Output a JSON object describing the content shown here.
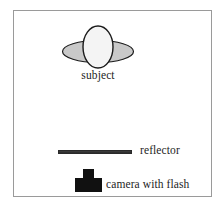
{
  "figure": {
    "background_color": "#ffffff",
    "frame_border_color": "#9a9a9a"
  },
  "elements": {
    "subject": {
      "label": "subject",
      "icon_name": "subject-head-and-shoulders-icon",
      "head_fill": "#f4f4f4",
      "shoulders_fill": "#c9c9c9",
      "outline_color": "#1b1b1b"
    },
    "reflector": {
      "label": "reflector",
      "icon_name": "reflector-bar-icon",
      "bar_fill": "#2f2f2f",
      "bar_highlight": "#8c8c8c"
    },
    "camera": {
      "label": "camera with flash",
      "icon_name": "camera-with-flash-icon",
      "fill": "#111111"
    }
  }
}
